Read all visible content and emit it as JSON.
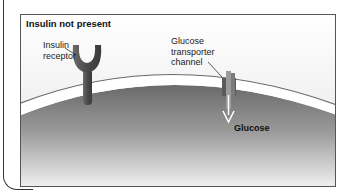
{
  "panel": {
    "title": "Insulin not present"
  },
  "labels": {
    "receptor_line1": "Insulin",
    "receptor_line2": "receptor",
    "channel_line1": "Glucose",
    "channel_line2": "transporter",
    "channel_line3": "channel",
    "glucose": "Glucose"
  },
  "colors": {
    "membrane_white": "#ffffff",
    "cell_interior_dark": "#6e6e6e",
    "cell_interior_light": "#e8e8e8",
    "receptor": "#5a5a5a",
    "channel": "#6a6a6a",
    "frame": "#555555"
  }
}
